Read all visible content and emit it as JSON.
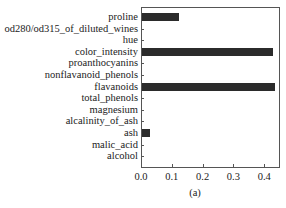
{
  "chart_data": {
    "type": "bar",
    "orientation": "horizontal",
    "title": "",
    "caption": "(a)",
    "xlabel": "",
    "ylabel": "",
    "xlim": [
      0.0,
      0.45
    ],
    "xticks": [
      "0.0",
      "0.1",
      "0.2",
      "0.3",
      "0.4"
    ],
    "grid": false,
    "bar_color": "#2b2b2b",
    "categories": [
      "proline",
      "od280/od315_of_diluted_wines",
      "hue",
      "color_intensity",
      "proanthocyanins",
      "nonflavanoid_phenols",
      "flavanoids",
      "total_phenols",
      "magnesium",
      "alcalinity_of_ash",
      "ash",
      "malic_acid",
      "alcohol"
    ],
    "values": [
      0.12,
      0.0,
      0.0,
      0.425,
      0.0,
      0.0,
      0.432,
      0.0,
      0.0,
      0.0,
      0.026,
      0.0,
      0.0
    ]
  }
}
